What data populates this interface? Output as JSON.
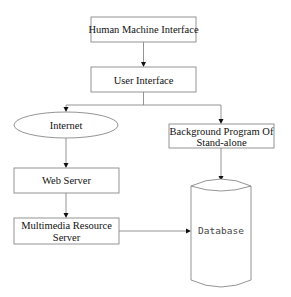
{
  "diagram": {
    "type": "flowchart",
    "nodes": {
      "hmi": {
        "label": "Human Machine Interface",
        "shape": "rectangle"
      },
      "ui": {
        "label": "User Interface",
        "shape": "rectangle"
      },
      "internet": {
        "label": "Internet",
        "shape": "ellipse"
      },
      "background": {
        "line1": "Background Program Of",
        "line2": "Stand-alone",
        "shape": "rectangle"
      },
      "web_server": {
        "label": "Web Server",
        "shape": "rectangle"
      },
      "multimedia": {
        "line1": "Multimedia Resource",
        "line2": "Server",
        "shape": "rectangle"
      },
      "database": {
        "label": "Database",
        "shape": "cylinder"
      }
    },
    "edges": [
      {
        "from": "Human Machine Interface",
        "to": "User Interface"
      },
      {
        "from": "User Interface",
        "to": "Internet"
      },
      {
        "from": "User Interface",
        "to": "Background Program Of Stand-alone"
      },
      {
        "from": "Internet",
        "to": "Web Server"
      },
      {
        "from": "Web Server",
        "to": "Multimedia Resource Server"
      },
      {
        "from": "Background Program Of Stand-alone",
        "to": "Database"
      },
      {
        "from": "Multimedia Resource Server",
        "to": "Database"
      }
    ],
    "colors": {
      "stroke": "#888888",
      "arrow": "#111111",
      "text": "#111111",
      "background": "#ffffff"
    }
  }
}
